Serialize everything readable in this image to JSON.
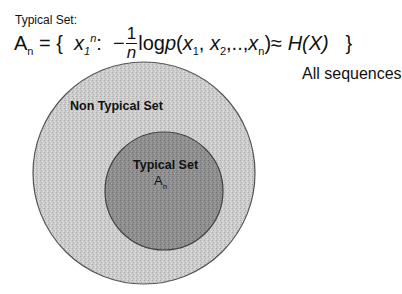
{
  "header": {
    "title": "Typical Set:",
    "formula": {
      "lhs_symbol": "A",
      "lhs_subscript": "n",
      "equals": "=",
      "open_brace": "{",
      "element_var": "x",
      "element_sub": "1",
      "element_sup": "n",
      "colon": ":",
      "minus": "−",
      "frac_num": "1",
      "frac_den": "n",
      "log_text": "log",
      "p_text": "p",
      "args_open": "(",
      "arg1": "x",
      "arg1_sub": "1",
      "comma1": ", ",
      "arg2": "x",
      "arg2_sub": "2",
      "ellipsis": ",..,",
      "argn": "x",
      "argn_sub": "n",
      "args_close": ")",
      "approx": "≈",
      "entropy": "H(X)",
      "close_brace": "}"
    }
  },
  "labels": {
    "all_sequences": "All sequences",
    "non_typical_set": "Non Typical Set",
    "typical_set": "Typical Set",
    "typical_symbol": "A",
    "typical_symbol_sub": "n"
  },
  "colors": {
    "outer_fill": "#c9c9c9",
    "inner_fill": "#8e8e8e",
    "outline": "#555555",
    "text": "#111111"
  },
  "geometry": {
    "outer_circle": {
      "cx": 144,
      "cy": 173,
      "r": 111
    },
    "inner_circle": {
      "cx": 164,
      "cy": 191,
      "r": 59
    }
  }
}
